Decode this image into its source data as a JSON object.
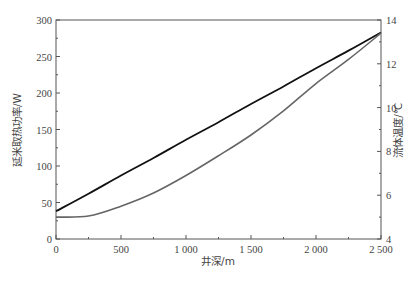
{
  "chart_data": {
    "type": "line",
    "title": "",
    "xlabel": "井深/m",
    "ylabel": "延米取热功率/W",
    "ylabel_right": "流体温度/℃",
    "xlim": [
      0,
      2500
    ],
    "ylim": [
      0,
      300
    ],
    "ylim_right": [
      4,
      14
    ],
    "x_ticks": [
      0,
      500,
      1000,
      1500,
      2000,
      2500
    ],
    "x_tick_labels": [
      "0",
      "500",
      "1 000",
      "1 500",
      "2 000",
      "2 500"
    ],
    "y_ticks": [
      0,
      50,
      100,
      150,
      200,
      250,
      300
    ],
    "y_tick_labels": [
      "0",
      "50",
      "100",
      "150",
      "200",
      "250",
      "300"
    ],
    "y_right_ticks": [
      4,
      6,
      8,
      10,
      12,
      14
    ],
    "y_right_tick_labels": [
      "4",
      "6",
      "8",
      "10",
      "12",
      "14"
    ],
    "grid": false,
    "legend": null,
    "x": [
      0,
      250,
      500,
      750,
      1000,
      1250,
      1500,
      1750,
      2000,
      2250,
      2500
    ],
    "series": [
      {
        "name": "延米取热功率",
        "axis": "left",
        "color": "#111111",
        "values": [
          38,
          62,
          87,
          111,
          136,
          160,
          185,
          209,
          234,
          258,
          283
        ]
      },
      {
        "name": "流体温度",
        "axis": "right",
        "color": "#666666",
        "values": [
          5.0,
          5.05,
          5.5,
          6.1,
          6.9,
          7.8,
          8.75,
          9.85,
          11.1,
          12.2,
          13.4
        ]
      }
    ]
  }
}
